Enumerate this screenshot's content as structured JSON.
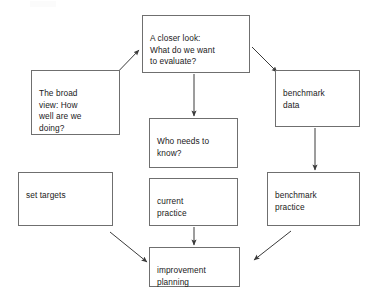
{
  "diagram": {
    "background_color": "#ffffff",
    "box_border_color": "#6f6f6f",
    "box_fill_color": "#ffffff",
    "text_color": "#1a1a1a",
    "arrow_color": "#3a3a3a",
    "nodes": [
      {
        "id": "closer-look",
        "label": "A closer look:\nWhat do we want\nto evaluate?",
        "x": 142,
        "y": 15,
        "w": 108,
        "h": 58
      },
      {
        "id": "broad-view",
        "label": "The broad\nview: How\nwell are we\ndoing?",
        "x": 31,
        "y": 70,
        "w": 89,
        "h": 65
      },
      {
        "id": "benchmark-data",
        "label": "benchmark\ndata",
        "x": 275,
        "y": 70,
        "w": 85,
        "h": 57
      },
      {
        "id": "who-needs-to-know",
        "label": "Who needs to\nknow?",
        "x": 149,
        "y": 118,
        "w": 89,
        "h": 50
      },
      {
        "id": "set-targets",
        "label": "set targets",
        "x": 18,
        "y": 172,
        "w": 95,
        "h": 54
      },
      {
        "id": "current-practice",
        "label": "current\npractice",
        "x": 149,
        "y": 178,
        "w": 89,
        "h": 48
      },
      {
        "id": "benchmark-practice",
        "label": "benchmark\npractice",
        "x": 267,
        "y": 172,
        "w": 93,
        "h": 54
      },
      {
        "id": "improvement-planning",
        "label": "improvement\nplanning",
        "x": 149,
        "y": 247,
        "w": 91,
        "h": 40
      }
    ],
    "arrows": [
      {
        "id": "broad-view-to-closer-look",
        "from": "broad-view",
        "to": "closer-look",
        "x1": 110,
        "y1": 80,
        "x2": 139,
        "y2": 50
      },
      {
        "id": "closer-look-to-benchmark-data",
        "from": "closer-look",
        "to": "benchmark-data",
        "x1": 252,
        "y1": 47,
        "x2": 277,
        "y2": 72
      },
      {
        "id": "closer-look-to-who-needs-to-know",
        "from": "closer-look",
        "to": "who-needs-to-know",
        "x1": 194,
        "y1": 74,
        "x2": 194,
        "y2": 116
      },
      {
        "id": "benchmark-data-to-benchmark-practice",
        "from": "benchmark-data",
        "to": "benchmark-practice",
        "x1": 315,
        "y1": 128,
        "x2": 315,
        "y2": 170
      },
      {
        "id": "current-practice-to-improvement-planning",
        "from": "current-practice",
        "to": "improvement-planning",
        "x1": 194,
        "y1": 227,
        "x2": 194,
        "y2": 245
      },
      {
        "id": "set-targets-to-improvement-planning",
        "from": "set-targets",
        "to": "improvement-planning",
        "x1": 110,
        "y1": 232,
        "x2": 147,
        "y2": 262
      },
      {
        "id": "benchmark-practice-to-improvement-planning",
        "from": "benchmark-practice",
        "to": "improvement-planning",
        "x1": 291,
        "y1": 231,
        "x2": 254,
        "y2": 260
      }
    ]
  }
}
